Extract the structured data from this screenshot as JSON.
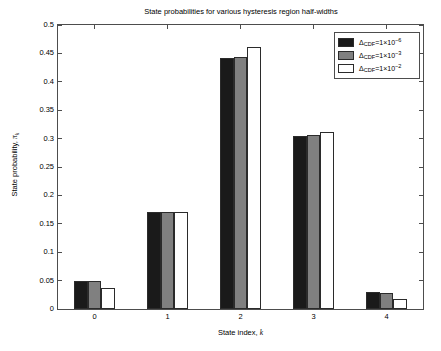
{
  "chart_data": {
    "type": "bar",
    "title": "State probabilities for various hysteresis region half-widths",
    "xlabel": "State index, k",
    "ylabel": "State probability, πk",
    "categories": [
      "0",
      "1",
      "2",
      "3",
      "4"
    ],
    "ylim": [
      0,
      0.5
    ],
    "ytick_labels": [
      "0",
      "0.05",
      "0.1",
      "0.15",
      "0.2",
      "0.25",
      "0.3",
      "0.35",
      "0.4",
      "0.45",
      "0.5"
    ],
    "ytick_values": [
      0,
      0.05,
      0.1,
      0.15,
      0.2,
      0.25,
      0.3,
      0.35,
      0.4,
      0.45,
      0.5
    ],
    "xtick_labels": [
      "0",
      "1",
      "2",
      "3",
      "4"
    ],
    "grid": false,
    "legend_position": "top-right",
    "series": [
      {
        "name": "ΔCDF=1×10⁻⁶",
        "color": "#1a1a1a",
        "values": [
          0.05,
          0.171,
          0.442,
          0.305,
          0.03
        ]
      },
      {
        "name": "ΔCDF=1×10⁻³",
        "color": "#808080",
        "values": [
          0.05,
          0.171,
          0.444,
          0.306,
          0.029
        ]
      },
      {
        "name": "ΔCDF=1×10⁻²",
        "color": "#ffffff",
        "values": [
          0.037,
          0.17,
          0.462,
          0.312,
          0.018
        ]
      }
    ]
  },
  "title": "State probabilities for various hysteresis region half-widths",
  "axes": {
    "x_label_prefix": "State index, ",
    "x_label_symbol": "k",
    "y_label_prefix": "State probability, ",
    "y_label_symbol": "π",
    "y_label_subscript": "k"
  },
  "legend": {
    "entries": [
      {
        "delta": "Δ",
        "sub": "CDF",
        "eq": "=1×10",
        "exp": "−6"
      },
      {
        "delta": "Δ",
        "sub": "CDF",
        "eq": "=1×10",
        "exp": "−3"
      },
      {
        "delta": "Δ",
        "sub": "CDF",
        "eq": "=1×10",
        "exp": "−2"
      }
    ]
  }
}
